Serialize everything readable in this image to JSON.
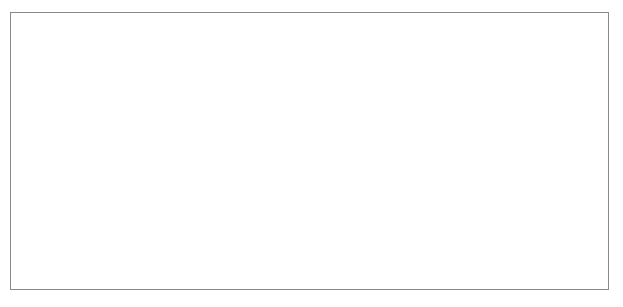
{
  "chart_data": {
    "type": "line",
    "title": "",
    "subtitle": "",
    "xlabel": "",
    "ylabel": "",
    "grid": "horizontal",
    "legend": "none",
    "marker": "filled-diamond",
    "ylim": [
      0,
      500000
    ],
    "ytick_values": [
      0,
      50000,
      100000,
      150000,
      200000,
      250000,
      300000,
      350000,
      400000,
      450000,
      500000
    ],
    "ytick_labels": [
      "0",
      "50,000",
      "100,000",
      "150,000",
      "200,000",
      "250,000",
      "300,000",
      "350,000",
      "400,000",
      "450,000",
      "500,000"
    ],
    "xlim": [
      1867,
      1914
    ],
    "xtick_labels": [
      "1867",
      "1869",
      "1871",
      "1873",
      "1875",
      "1877",
      "1879",
      "1881",
      "1883",
      "1885",
      "1887",
      "1889",
      "1891",
      "1893",
      "1895",
      "1897",
      "1899",
      "1901",
      "1903",
      "1905",
      "1907",
      "1909",
      "1911",
      "1913"
    ],
    "xtick_step": 2,
    "x": [
      1867,
      1868,
      1869,
      1870,
      1871,
      1872,
      1873,
      1874,
      1875,
      1876,
      1877,
      1878,
      1879,
      1880,
      1881,
      1882,
      1883,
      1884,
      1885,
      1886,
      1887,
      1888,
      1889,
      1890,
      1891,
      1892,
      1893,
      1894,
      1895,
      1896,
      1897,
      1898,
      1899,
      1900,
      1901,
      1902,
      1903,
      1904,
      1905,
      1906,
      1907,
      1908,
      1909,
      1910,
      1911,
      1912,
      1913,
      1914
    ],
    "values": [
      249000,
      219000,
      273000,
      290000,
      288000,
      278000,
      326000,
      397000,
      284000,
      266000,
      258000,
      258000,
      347000,
      344000,
      381000,
      347000,
      381000,
      362000,
      320000,
      334000,
      269000,
      292000,
      259000,
      252000,
      306000,
      258000,
      258000,
      277000,
      326000,
      276000,
      293000,
      304000,
      312000,
      308000,
      359000,
      338000,
      299000,
      352000,
      368000,
      377000,
      434000,
      378000,
      351000,
      296000,
      352000,
      351000,
      305000,
      272000
    ],
    "series_name": ""
  }
}
